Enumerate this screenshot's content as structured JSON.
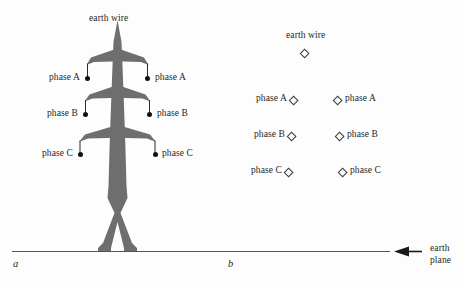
{
  "figure": {
    "ground_line_color": "#555555",
    "tower_fill_color": "#6e6e6e",
    "marker_dot_color": "#111111",
    "marker_diamond_color": "#3a3a3a"
  },
  "panel_a": {
    "letter": "a",
    "earth_wire_label": "earth wire",
    "conductors": [
      {
        "name": "phase-a",
        "left_label": "phase A",
        "right_label": "phase A"
      },
      {
        "name": "phase-b",
        "left_label": "phase B",
        "right_label": "phase B"
      },
      {
        "name": "phase-c",
        "left_label": "phase C",
        "right_label": "phase C"
      }
    ]
  },
  "panel_b": {
    "letter": "b",
    "earth_wire_label": "earth wire",
    "conductors": [
      {
        "name": "phase-a",
        "left_label": "phase A",
        "right_label": "phase A"
      },
      {
        "name": "phase-b",
        "left_label": "phase B",
        "right_label": "phase B"
      },
      {
        "name": "phase-c",
        "left_label": "phase C",
        "right_label": "phase C"
      }
    ],
    "earth_plane_label_line1": "earth",
    "earth_plane_label_line2": "plane"
  }
}
